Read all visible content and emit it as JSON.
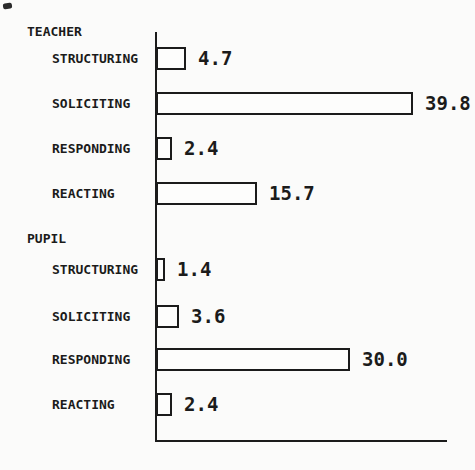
{
  "chart_data": {
    "type": "bar",
    "orientation": "horizontal",
    "title": "",
    "xlabel": "",
    "ylabel": "",
    "xlim": [
      0,
      45
    ],
    "grid": false,
    "legend": "none",
    "bar_fill": "#fdfdfc",
    "bar_border": "#1b1b1b",
    "value_labels_shown": true,
    "groups": [
      {
        "label": "TEACHER",
        "items": [
          {
            "category": "STRUCTURING",
            "value": 4.7,
            "value_text": "4.7"
          },
          {
            "category": "SOLICITING",
            "value": 39.8,
            "value_text": "39.8"
          },
          {
            "category": "RESPONDING",
            "value": 2.4,
            "value_text": "2.4"
          },
          {
            "category": "REACTING",
            "value": 15.7,
            "value_text": "15.7"
          }
        ]
      },
      {
        "label": "PUPIL",
        "items": [
          {
            "category": "STRUCTURING",
            "value": 1.4,
            "value_text": "1.4"
          },
          {
            "category": "SOLICITING",
            "value": 3.6,
            "value_text": "3.6"
          },
          {
            "category": "RESPONDING",
            "value": 30.0,
            "value_text": "30.0"
          },
          {
            "category": "REACTING",
            "value": 2.4,
            "value_text": "2.4"
          }
        ]
      }
    ],
    "colors": {
      "ink": "#1b1b1b",
      "paper": "#fbfbfa"
    }
  }
}
